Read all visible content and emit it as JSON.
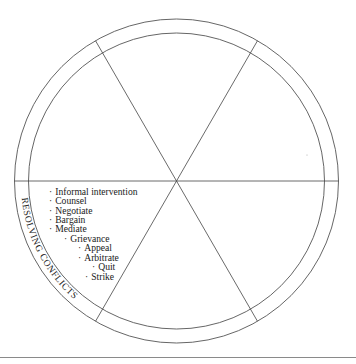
{
  "diagram": {
    "center": {
      "x": 176.5,
      "y": 181
    },
    "outer_radius": 162,
    "inner_radius": 148,
    "spoke_angles_deg": [
      0,
      60,
      120
    ],
    "segments": 6,
    "colors": {
      "line": "#444444",
      "text": "#1a1a1a",
      "rule": "#8a8a8a"
    },
    "filled_segment": {
      "position": "lower-left",
      "ring_label": "RESOLVING CONFLICTS",
      "items": [
        {
          "label": "Informal intervention",
          "indent": 0
        },
        {
          "label": "Counsel",
          "indent": 0
        },
        {
          "label": "Negotiate",
          "indent": 0
        },
        {
          "label": "Bargain",
          "indent": 0
        },
        {
          "label": "Mediate",
          "indent": 0
        },
        {
          "label": "Grievance",
          "indent": 1
        },
        {
          "label": "Appeal",
          "indent": 2
        },
        {
          "label": "Arbitrate",
          "indent": 2
        },
        {
          "label": "Quit",
          "indent": 3
        },
        {
          "label": "Strike",
          "indent": 2.5
        }
      ]
    },
    "bullet_glyph": "·"
  }
}
